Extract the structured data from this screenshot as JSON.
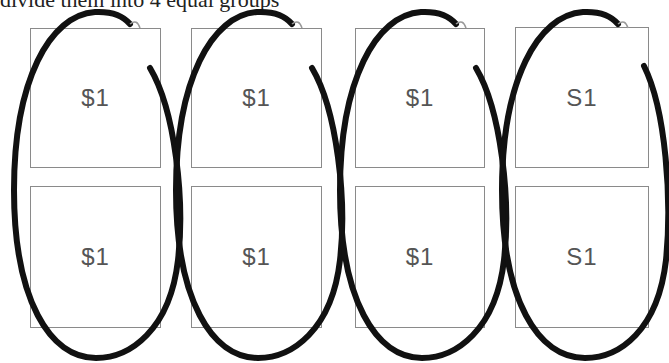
{
  "caption": "divide them into 4 equal groups",
  "bills": [
    {
      "label": "$1",
      "col": 0,
      "row": 0
    },
    {
      "label": "$1",
      "col": 1,
      "row": 0
    },
    {
      "label": "$1",
      "col": 2,
      "row": 0
    },
    {
      "label": "S1",
      "col": 3,
      "row": 0
    },
    {
      "label": "$1",
      "col": 0,
      "row": 1
    },
    {
      "label": "$1",
      "col": 1,
      "row": 1
    },
    {
      "label": "$1",
      "col": 2,
      "row": 1
    },
    {
      "label": "S1",
      "col": 3,
      "row": 1
    }
  ],
  "groups": 4,
  "colors": {
    "bill_border": "#8a8a8a",
    "loop_stroke": "#111111",
    "text": "#555555"
  }
}
